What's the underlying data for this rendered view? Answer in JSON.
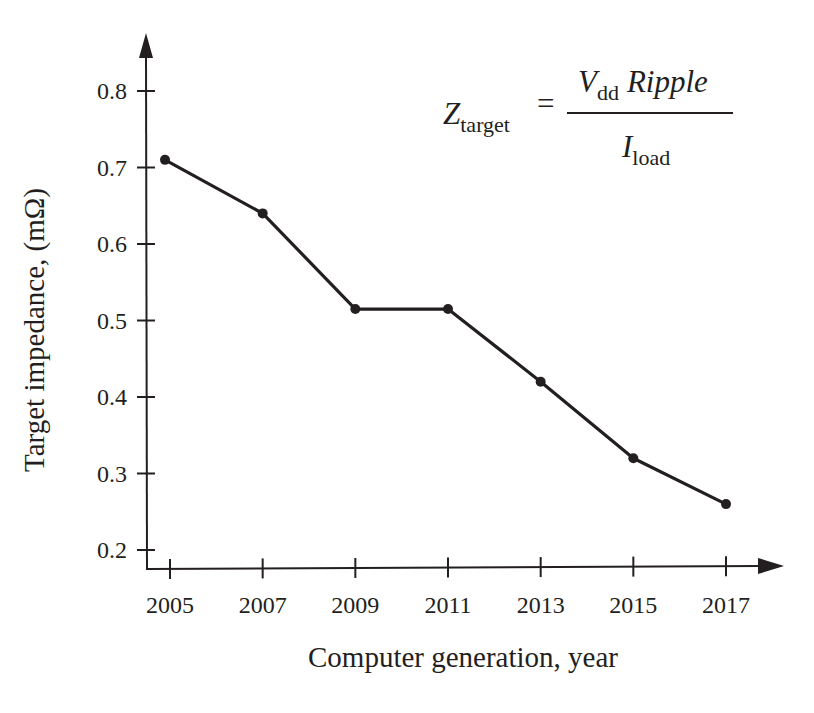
{
  "chart_data": {
    "type": "line",
    "title": "",
    "xlabel": "Computer generation, year",
    "ylabel": "Target impedance, (mΩ)",
    "x": [
      2005,
      2007,
      2009,
      2011,
      2013,
      2015,
      2017
    ],
    "x_ticks": [
      "2005",
      "2007",
      "2009",
      "2011",
      "2013",
      "2015",
      "2017"
    ],
    "y_ticks": [
      "0.2",
      "0.3",
      "0.4",
      "0.5",
      "0.6",
      "0.7",
      "0.8"
    ],
    "ylim": [
      0.2,
      0.8
    ],
    "grid": false,
    "legend": null,
    "series": [
      {
        "name": "Target impedance",
        "values": [
          0.71,
          0.64,
          0.515,
          0.515,
          0.42,
          0.32,
          0.26
        ]
      }
    ],
    "annotations": [
      {
        "type": "formula",
        "text": "Z_target = (V_dd Ripple) / I_load"
      }
    ]
  },
  "formula": {
    "lhs_main": "Z",
    "lhs_sub": "target",
    "equals": "=",
    "num_main": "V",
    "num_sub": "dd",
    "num_rest": "Ripple",
    "den_main": "I",
    "den_sub": "load"
  },
  "colors": {
    "ink": "#231f20",
    "background": "#ffffff"
  }
}
